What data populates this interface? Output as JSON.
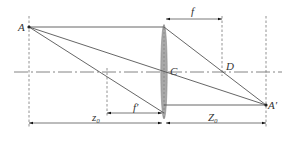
{
  "diagram": {
    "type": "thin-lens-imaging",
    "labels": {
      "object_point": "A",
      "image_point": "A′",
      "lens_center": "C",
      "focal_point": "D",
      "focal_length_top": "f",
      "focal_length_bottom": "f′",
      "object_distance": "z₀",
      "image_distance": "Z₀"
    },
    "colors": {
      "lens_fill": "#a0a0a0",
      "line": "#555555",
      "text": "#333333"
    }
  }
}
